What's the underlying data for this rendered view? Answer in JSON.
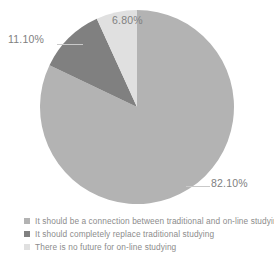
{
  "chart_data": {
    "type": "pie",
    "title": "",
    "categories": [
      "It should be a connection between traditional and on-line studying",
      "It should completely replace traditional studying",
      "There is no future for on-line studying"
    ],
    "values": [
      82.1,
      11.1,
      6.8
    ],
    "value_labels": [
      "82.10%",
      "11.10%",
      "6.80%"
    ],
    "colors": [
      "#b3b3b3",
      "#808080",
      "#e0e0e0"
    ],
    "unit": "%",
    "legend_position": "bottom-left",
    "grid": false,
    "start_angle_deg": 0,
    "direction": "clockwise",
    "background": "#ffffff",
    "label_color": "#808080",
    "leader_line_color": "#c9c9c9"
  },
  "labels": {
    "main": "82.10%",
    "dark": "11.10%",
    "light": "6.80%"
  },
  "legend": {
    "items": [
      {
        "label": "It should be a connection between traditional and on-line studying",
        "color": "#b3b3b3",
        "swatch_name": "legend-swatch-connection"
      },
      {
        "label": "It should completely replace traditional studying",
        "color": "#808080",
        "swatch_name": "legend-swatch-replace"
      },
      {
        "label": "There is no future for on-line studying",
        "color": "#e0e0e0",
        "swatch_name": "legend-swatch-no-future"
      }
    ]
  }
}
